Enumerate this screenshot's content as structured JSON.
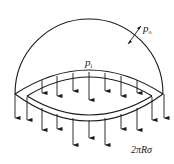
{
  "figure": {
    "labels": {
      "external_pressure": {
        "symbol": "p",
        "subscript": "o"
      },
      "internal_pressure": {
        "symbol": "p",
        "subscript": "i"
      },
      "wall_force": "2πRσ"
    },
    "colors": {
      "stroke": "#1a1a1a",
      "background": "#ffffff"
    },
    "arrows": {
      "upper_inner_x": [
        42,
        57,
        73,
        89,
        105,
        121,
        137
      ],
      "lower_outer_x": [
        15,
        27,
        42,
        57,
        73,
        89,
        105,
        121,
        137,
        152,
        164
      ]
    }
  }
}
